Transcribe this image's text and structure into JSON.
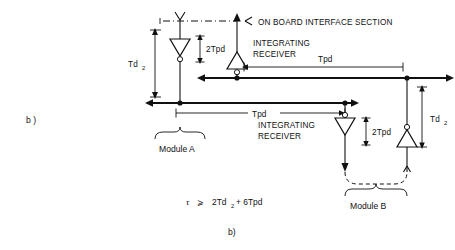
{
  "figure": {
    "part_label_left": "b )",
    "caption_bottom": "b)",
    "interface_label": "ON BOARD INTERFACE SECTION",
    "formula": {
      "tau": "τ",
      "relation": "⩾",
      "expression_a": "2Td",
      "expression_a_sub": "2",
      "expression_b": "+ 6Tpd",
      "full": "τ ⩾ 2Td2 + 6Tpd"
    },
    "modules": [
      {
        "name": "module-a",
        "label": "Module A"
      },
      {
        "name": "module-b",
        "label": "Module B"
      }
    ],
    "receivers": [
      {
        "name": "integrating-receiver-a",
        "line1": "INTEGRATING",
        "line2": "RECEIVER"
      },
      {
        "name": "integrating-receiver-b",
        "line1": "INTEGRATING",
        "line2": "RECEIVER"
      }
    ],
    "delay_labels": [
      {
        "name": "td2-left",
        "text": "Td",
        "sub": "2"
      },
      {
        "name": "td2-right",
        "text": "Td",
        "sub": "2"
      },
      {
        "name": "twotpd-top-left",
        "text": "2Tpd"
      },
      {
        "name": "twotpd-module-b",
        "text": "2Tpd"
      },
      {
        "name": "tpd-upper-right",
        "text": "Tpd"
      },
      {
        "name": "tpd-middle",
        "text": "Tpd"
      }
    ],
    "colors": {
      "ink": "#111111",
      "paper": "#ffffff"
    }
  }
}
